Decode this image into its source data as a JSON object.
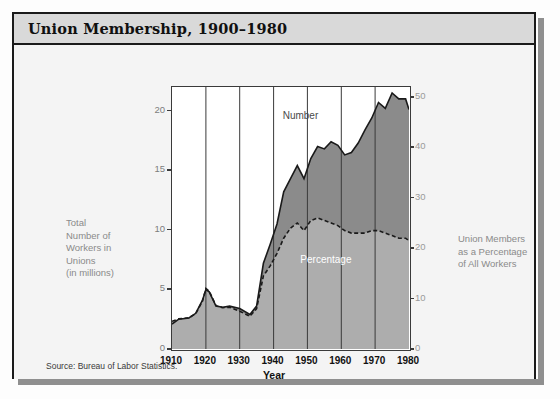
{
  "title": "Union Membership,  1900–1980",
  "source": "Source: Bureau of Labor Statistics.",
  "axis": {
    "x_title": "Year",
    "left_label": "Total\nNumber of\nWorkers in\nUnions\n(in millions)",
    "left_label_lines": [
      "Total",
      "Number of",
      "Workers in",
      "Unions",
      "(in millions)"
    ],
    "right_label_lines": [
      "Union Members",
      "as a Percentage",
      "of All Workers"
    ]
  },
  "labels": {
    "number": "Number",
    "percentage": "Percentage"
  },
  "colors": {
    "number_area": "#8b8b8b",
    "percentage_area": "#adadad",
    "plot_bg": "#ffffff",
    "frame": "#1a1a1a",
    "titlebar": "#d9d9d9",
    "card_bg": "#f4f4f4"
  },
  "chart_data": {
    "type": "area",
    "title": "Union Membership,  1900–1980",
    "xlabel": "Year",
    "grid": true,
    "legend": "inline",
    "x": [
      1910,
      1915,
      1920,
      1925,
      1930,
      1935,
      1940,
      1945,
      1950,
      1955,
      1960,
      1965,
      1970,
      1975,
      1980
    ],
    "xlim": [
      1910,
      1980
    ],
    "xticks": [
      1910,
      1920,
      1930,
      1940,
      1950,
      1960,
      1970,
      1980
    ],
    "axes": [
      {
        "name": "left",
        "ylabel": "Total Number of Workers in Unions (in millions)",
        "ylim": [
          0,
          22
        ],
        "yticks": [
          0,
          5,
          10,
          15,
          20
        ]
      },
      {
        "name": "right",
        "ylabel": "Union Members as a Percentage of All Workers",
        "ylim": [
          0,
          52
        ],
        "yticks": [
          0,
          10,
          20,
          30,
          40,
          50
        ]
      }
    ],
    "series": [
      {
        "name": "Number",
        "axis": "left",
        "units": "millions",
        "color": "#8b8b8b",
        "x": [
          1910,
          1912,
          1915,
          1917,
          1919,
          1920,
          1921,
          1923,
          1925,
          1927,
          1930,
          1933,
          1935,
          1937,
          1939,
          1941,
          1943,
          1945,
          1947,
          1949,
          1951,
          1953,
          1955,
          1957,
          1959,
          1961,
          1963,
          1965,
          1967,
          1969,
          1971,
          1973,
          1975,
          1977,
          1979,
          1980
        ],
        "values": [
          2.1,
          2.5,
          2.6,
          3.0,
          4.1,
          5.0,
          4.8,
          3.6,
          3.5,
          3.6,
          3.4,
          2.9,
          3.6,
          7.2,
          8.8,
          10.5,
          13.2,
          14.3,
          15.4,
          14.3,
          16.0,
          17.0,
          16.8,
          17.4,
          17.1,
          16.3,
          16.5,
          17.3,
          18.4,
          19.4,
          20.7,
          20.2,
          21.5,
          21.0,
          21.0,
          20.1
        ]
      },
      {
        "name": "Percentage",
        "axis": "right",
        "units": "percent of all workers",
        "color": "#adadad",
        "line_style": "dashed",
        "x": [
          1910,
          1912,
          1915,
          1917,
          1919,
          1920,
          1921,
          1923,
          1925,
          1927,
          1930,
          1933,
          1935,
          1937,
          1939,
          1941,
          1943,
          1945,
          1947,
          1949,
          1951,
          1953,
          1955,
          1957,
          1959,
          1961,
          1963,
          1965,
          1967,
          1969,
          1971,
          1973,
          1975,
          1977,
          1979,
          1980
        ],
        "values": [
          5.5,
          6.0,
          6.2,
          7.0,
          9.5,
          12.0,
          11.5,
          8.6,
          8.2,
          8.3,
          7.5,
          6.5,
          8.0,
          14.5,
          16.5,
          19.0,
          22.0,
          24.0,
          25.0,
          23.5,
          25.5,
          26.0,
          25.5,
          25.0,
          24.5,
          23.5,
          23.0,
          23.0,
          23.0,
          23.5,
          23.5,
          23.0,
          22.5,
          22.0,
          22.0,
          21.5
        ]
      }
    ],
    "annotations": [
      {
        "text": "Number",
        "x": 1948,
        "y_axis": "left",
        "y": 19.5
      },
      {
        "text": "Percentage",
        "x": 1955,
        "y_axis": "right",
        "y": 17.5
      }
    ],
    "notes": "Source: Bureau of Labor Statistics."
  }
}
